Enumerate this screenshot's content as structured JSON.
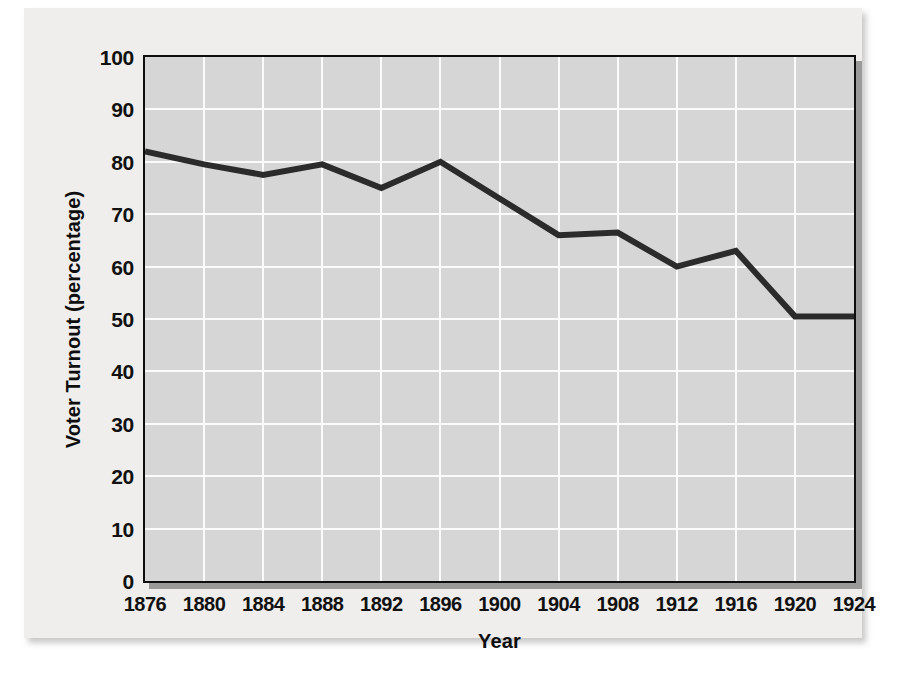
{
  "chart_data": {
    "type": "line",
    "title": "",
    "xlabel": "Year",
    "ylabel": "Voter Turnout (percentage)",
    "x": [
      1876,
      1880,
      1884,
      1888,
      1892,
      1896,
      1900,
      1904,
      1908,
      1912,
      1916,
      1920,
      1924
    ],
    "values": [
      82,
      79.5,
      77.5,
      79.5,
      75,
      80,
      73,
      66,
      66.5,
      60,
      63,
      50.5,
      50.5
    ],
    "series": [
      {
        "name": "Voter Turnout",
        "values": [
          82,
          79.5,
          77.5,
          79.5,
          75,
          80,
          73,
          66,
          66.5,
          60,
          63,
          50.5,
          50.5
        ]
      }
    ],
    "xtick_labels": [
      "1876",
      "1880",
      "1884",
      "1888",
      "1892",
      "1896",
      "1900",
      "1904",
      "1908",
      "1912",
      "1916",
      "1920",
      "1924"
    ],
    "ytick_labels": [
      "0",
      "10",
      "20",
      "30",
      "40",
      "50",
      "60",
      "70",
      "80",
      "90",
      "100"
    ],
    "yticks": [
      0,
      10,
      20,
      30,
      40,
      50,
      60,
      70,
      80,
      90,
      100
    ],
    "ylim": [
      0,
      100
    ],
    "xlim": [
      1876,
      1924
    ],
    "grid": true,
    "legend": false,
    "legend_position": "none",
    "line_color": "#2b2b2b",
    "plot_background": "#d6d6d6",
    "gridline_color": "#fbfbfb",
    "figure_background": "#efeeec",
    "axis_color": "#0d0d0d"
  }
}
